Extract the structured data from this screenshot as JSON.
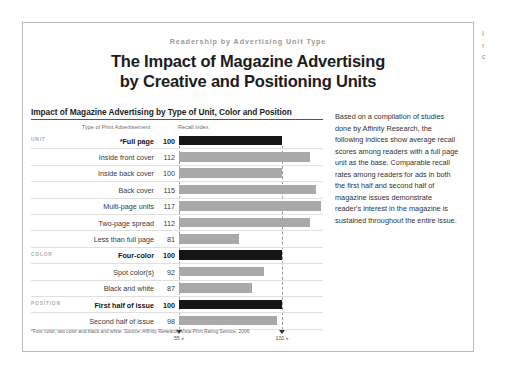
{
  "document": {
    "eyebrow": "Readership by Advertising Unit Type",
    "title_line1": "The Impact of Magazine Advertising",
    "title_line2": "by Creative and Positioning Units"
  },
  "chart_panel": {
    "heading": "Impact of Magazine Advertising by Type of Unit, Color and Position",
    "column_headers": {
      "category": "Type of Print Advertisement",
      "value": "Recall index"
    },
    "footnote": "*Four color, two color and black and white. Source: Affinity Research Vista Print Rating Service, 2006"
  },
  "commentary": {
    "paragraph": "Based on a compilation of studies done by Affinity Research, the following indices show average recall scores among readers with a full page unit as the base. Comparable recall rates among readers for ads in both the first half and second half of magazine issues demonstrate reader's interest in the magazine is sustained throughout the entire issue."
  },
  "edge_bleed": {
    "line1": "I",
    "line2": "r",
    "line3": "c"
  },
  "colors": {
    "bar_default": "#a9a9a9",
    "bar_emphasis": "#161616",
    "gridline": "#9b9b9b",
    "eyebrow": "#9a9a9a",
    "group_label": "#adadad"
  },
  "chart_data": {
    "type": "bar",
    "title": "Impact of Magazine Advertising by Type of Unit, Color and Position",
    "xlabel": "Recall index",
    "ylabel": "Type of Print Advertisement",
    "orientation": "horizontal",
    "xlim": [
      55,
      120
    ],
    "axis_ticks": [
      {
        "label": "55 »",
        "value": 55
      },
      {
        "label": "100 »",
        "value": 100
      }
    ],
    "grid": true,
    "legend": "none",
    "groups": [
      {
        "group": "UNIT",
        "rows": [
          {
            "label": "*Full page",
            "value": 100,
            "emphasis": true
          },
          {
            "label": "Inside front cover",
            "value": 112,
            "emphasis": false
          },
          {
            "label": "Inside back cover",
            "value": 100,
            "emphasis": false
          },
          {
            "label": "Back cover",
            "value": 115,
            "emphasis": false
          },
          {
            "label": "Multi-page units",
            "value": 117,
            "emphasis": false
          },
          {
            "label": "Two-page spread",
            "value": 112,
            "emphasis": false
          },
          {
            "label": "Less than full page",
            "value": 81,
            "emphasis": false
          }
        ]
      },
      {
        "group": "COLOR",
        "rows": [
          {
            "label": "Four-color",
            "value": 100,
            "emphasis": true
          },
          {
            "label": "Spot color(s)",
            "value": 92,
            "emphasis": false
          },
          {
            "label": "Black and white",
            "value": 87,
            "emphasis": false
          }
        ]
      },
      {
        "group": "POSITION",
        "rows": [
          {
            "label": "First half of issue",
            "value": 100,
            "emphasis": true
          },
          {
            "label": "Second half of issue",
            "value": 98,
            "emphasis": false
          }
        ]
      }
    ],
    "categories": [
      "*Full page",
      "Inside front cover",
      "Inside back cover",
      "Back cover",
      "Multi-page units",
      "Two-page spread",
      "Less than full page",
      "Four-color",
      "Spot color(s)",
      "Black and white",
      "First half of issue",
      "Second half of issue"
    ],
    "values": [
      100,
      112,
      100,
      115,
      117,
      112,
      81,
      100,
      92,
      87,
      100,
      98
    ]
  }
}
